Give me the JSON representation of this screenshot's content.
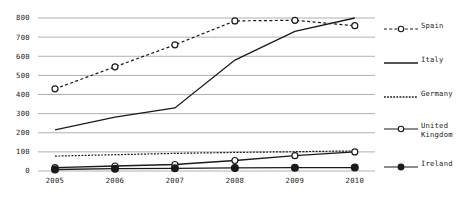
{
  "chart_data": {
    "type": "line",
    "title": "",
    "xlabel": "",
    "ylabel": "",
    "categories": [
      "2005",
      "2006",
      "2007",
      "2008",
      "2009",
      "2010"
    ],
    "x": [
      2005,
      2006,
      2007,
      2008,
      2009,
      2010
    ],
    "ylim": [
      0,
      800
    ],
    "yticks": [
      0,
      100,
      200,
      300,
      400,
      500,
      600,
      700,
      800
    ],
    "ytick_labels": [
      "0",
      "100",
      "200",
      "300",
      "400",
      "500",
      "600",
      "700",
      "800"
    ],
    "xtick_labels": [
      "2005",
      "2006",
      "2007",
      "2008",
      "2009",
      "2010"
    ],
    "grid": true,
    "grid_axis": "y",
    "legend_position": "right",
    "series": [
      {
        "name": "Spain",
        "values": [
          430,
          545,
          660,
          785,
          788,
          760
        ],
        "line_style": "dashed",
        "marker": "open-circle",
        "color": "#1a1a1a"
      },
      {
        "name": "Italy",
        "values": [
          215,
          282,
          330,
          580,
          730,
          800
        ],
        "line_style": "solid",
        "marker": "none",
        "color": "#1a1a1a"
      },
      {
        "name": "Germany",
        "values": [
          78,
          85,
          92,
          97,
          101,
          105
        ],
        "line_style": "dotted",
        "marker": "none",
        "color": "#1a1a1a"
      },
      {
        "name": "United Kingdom",
        "values": [
          18,
          26,
          34,
          55,
          80,
          100
        ],
        "line_style": "solid",
        "marker": "open-circle",
        "color": "#1a1a1a"
      },
      {
        "name": "Ireland",
        "values": [
          8,
          12,
          14,
          16,
          17,
          18
        ],
        "line_style": "solid",
        "marker": "filled-circle",
        "color": "#1a1a1a"
      }
    ]
  },
  "legend": {
    "items": [
      {
        "label": "Spain",
        "style": "dashed-open-circle"
      },
      {
        "label": "Italy",
        "style": "solid"
      },
      {
        "label": "Germany",
        "style": "dotted"
      },
      {
        "label": "United\nKingdom",
        "style": "solid-open-circle"
      },
      {
        "label": "Ireland",
        "style": "solid-filled-circle"
      }
    ]
  },
  "colors": {
    "ink": "#1a1a1a",
    "grid": "#b0b0b0",
    "background": "#ffffff"
  }
}
